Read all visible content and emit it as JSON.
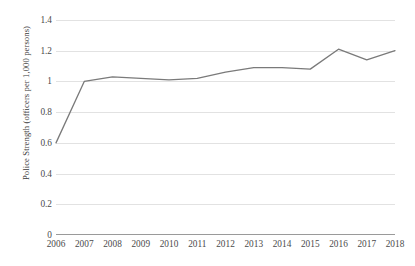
{
  "chart_data": {
    "type": "line",
    "title": "",
    "xlabel": "",
    "ylabel": "Police Strength (officers per 1,000 persons)",
    "categories": [
      "2006",
      "2007",
      "2008",
      "2009",
      "2010",
      "2011",
      "2012",
      "2013",
      "2014",
      "2015",
      "2016",
      "2017",
      "2018"
    ],
    "values": [
      0.6,
      1.0,
      1.03,
      1.02,
      1.01,
      1.02,
      1.06,
      1.09,
      1.09,
      1.08,
      1.21,
      1.14,
      1.2
    ],
    "series": [
      {
        "name": "Police Strength",
        "values": [
          0.6,
          1.0,
          1.03,
          1.02,
          1.01,
          1.02,
          1.06,
          1.09,
          1.09,
          1.08,
          1.21,
          1.14,
          1.2
        ]
      }
    ],
    "ylim": [
      0,
      1.4
    ],
    "ytick_labels": [
      "0",
      "0.2",
      "0.4",
      "0.6",
      "0.8",
      "1",
      "1.2",
      "1.4"
    ],
    "ytick_values": [
      0,
      0.2,
      0.4,
      0.6,
      0.8,
      1.0,
      1.2,
      1.4
    ],
    "grid": true,
    "legend_position": "none",
    "line_color": "#7a7a7a",
    "gridline_color": "#e2e2e2",
    "axis_color": "#9a9a9a",
    "background_color": "#ffffff"
  }
}
